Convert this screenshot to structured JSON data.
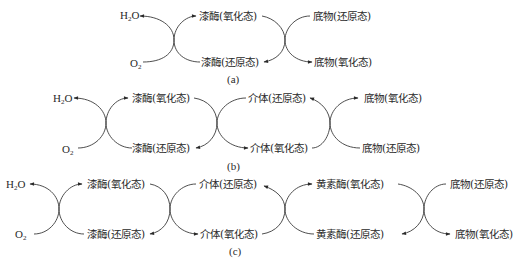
{
  "panels": {
    "a": {
      "caption": "(a)",
      "h2o": "H",
      "h2o_sub": "2",
      "h2o_tail": "O",
      "o2": "O",
      "o2_sub": "2",
      "enzyme_ox": "漆酶(氧化态)",
      "enzyme_red": "漆酶(还原态)",
      "substrate_red": "底物(还原态)",
      "substrate_ox": "底物(氧化态)"
    },
    "b": {
      "caption": "(b)",
      "h2o": "H",
      "h2o_sub": "2",
      "h2o_tail": "O",
      "o2": "O",
      "o2_sub": "2",
      "enzyme_ox": "漆酶(氧化态)",
      "enzyme_red": "漆酶(还原态)",
      "mediator_red": "介体(还原态)",
      "mediator_ox": "介体(氧化态)",
      "substrate_ox": "底物(氧化态)",
      "substrate_red": "底物(还原态)"
    },
    "c": {
      "caption": "(c)",
      "h2o": "H",
      "h2o_sub": "2",
      "h2o_tail": "O",
      "o2": "O",
      "o2_sub": "2",
      "enzyme_ox": "漆酶(氧化态)",
      "enzyme_red": "漆酶(还原态)",
      "mediator_red": "介体(还原态)",
      "mediator_ox": "介体(氧化态)",
      "flavo_ox": "黄素酶(氧化态)",
      "flavo_red": "黄素酶(还原态)",
      "substrate_red": "底物(还原态)",
      "substrate_ox": "底物(氧化态)"
    }
  },
  "colors": {
    "line": "#3a3a3a",
    "text": "#2a2a2a",
    "background": "#ffffff"
  }
}
